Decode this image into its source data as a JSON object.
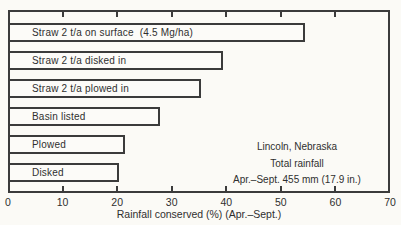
{
  "figure": {
    "background": "#fbfaf6",
    "ink": "#3b3b3b",
    "bar_fill": "#fcfbf8"
  },
  "chart_data": {
    "type": "bar",
    "orientation": "horizontal",
    "categories": [
      "Straw 2 t/a on surface  (4.5 Mg/ha)",
      "Straw 2 t/a disked in",
      "Straw 2 t/a plowed in",
      "Basin listed",
      "Plowed",
      "Disked"
    ],
    "values": [
      54,
      39,
      35,
      27.5,
      21,
      20
    ],
    "title": "",
    "xlabel": "Rainfall conserved (%) (Apr.–Sept.)",
    "ylabel": "",
    "xlim": [
      0,
      70
    ],
    "xticks": [
      0,
      10,
      20,
      30,
      40,
      50,
      60,
      70
    ],
    "grid": false,
    "labels_inside_bars": true,
    "annotation": [
      "Lincoln, Nebraska",
      "Total rainfall",
      "Apr.–Sept. 455 mm (17.9 in.)"
    ]
  }
}
